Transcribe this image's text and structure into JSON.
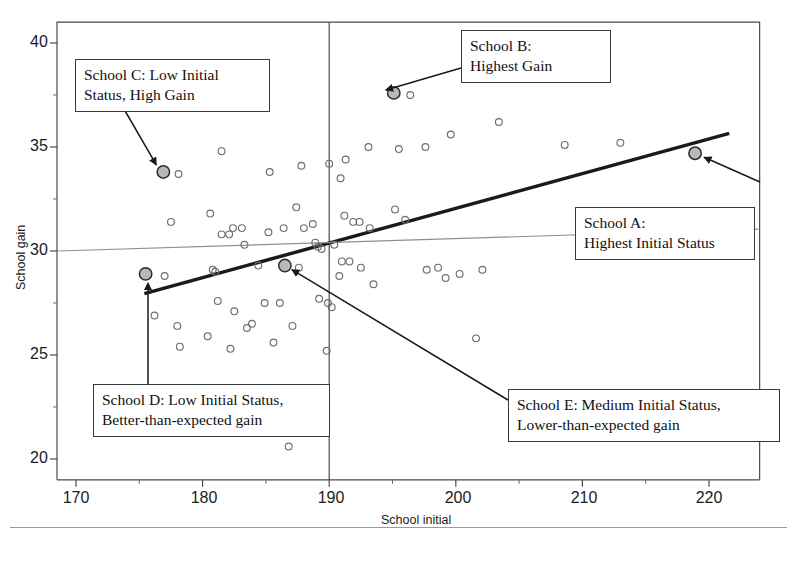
{
  "chart_data": {
    "type": "scatter",
    "title": "",
    "xlabel": "School initial",
    "ylabel": "School gain",
    "xlim": [
      168.5,
      224
    ],
    "ylim": [
      19.0,
      41.0
    ],
    "xticks": [
      170,
      180,
      190,
      200,
      210,
      220
    ],
    "yticks": [
      20,
      25,
      30,
      35,
      40
    ],
    "xminorticks": [
      175,
      185,
      195,
      205,
      215
    ],
    "yminorticks": [
      22.5,
      27.5,
      32.5,
      37.5
    ],
    "grid": false,
    "legend": "none",
    "marker_style": "open-circle",
    "highlight_marker_style": "filled-gray-circle",
    "highlight_fill": "#b8b8b8",
    "highlight_stroke": "#2b2b2b",
    "reference_line_vertical_x": 190,
    "series": [
      {
        "name": "Schools",
        "points": [
          [
            176.9,
            33.8
          ],
          [
            178.1,
            33.7
          ],
          [
            181.5,
            34.8
          ],
          [
            185.3,
            33.8
          ],
          [
            187.8,
            34.1
          ],
          [
            190.0,
            34.2
          ],
          [
            191.3,
            34.4
          ],
          [
            190.9,
            33.5
          ],
          [
            193.1,
            35.0
          ],
          [
            195.1,
            37.6
          ],
          [
            196.4,
            37.5
          ],
          [
            195.5,
            34.9
          ],
          [
            197.6,
            35.0
          ],
          [
            199.6,
            35.6
          ],
          [
            203.4,
            36.2
          ],
          [
            208.6,
            35.1
          ],
          [
            213.0,
            35.2
          ],
          [
            218.9,
            34.7
          ],
          [
            177.5,
            31.4
          ],
          [
            180.6,
            31.8
          ],
          [
            182.4,
            31.1
          ],
          [
            183.1,
            31.1
          ],
          [
            181.5,
            30.8
          ],
          [
            182.1,
            30.8
          ],
          [
            183.3,
            30.3
          ],
          [
            185.2,
            30.9
          ],
          [
            186.4,
            31.1
          ],
          [
            187.4,
            32.1
          ],
          [
            188.0,
            31.1
          ],
          [
            188.7,
            31.3
          ],
          [
            189.1,
            30.2
          ],
          [
            189.4,
            30.1
          ],
          [
            188.9,
            30.4
          ],
          [
            190.4,
            30.3
          ],
          [
            191.2,
            31.7
          ],
          [
            191.9,
            31.4
          ],
          [
            192.4,
            31.4
          ],
          [
            193.2,
            31.1
          ],
          [
            195.2,
            32.0
          ],
          [
            196.0,
            31.5
          ],
          [
            191.0,
            29.5
          ],
          [
            191.6,
            29.5
          ],
          [
            192.5,
            29.2
          ],
          [
            190.8,
            28.8
          ],
          [
            193.5,
            28.4
          ],
          [
            197.7,
            29.1
          ],
          [
            198.6,
            29.2
          ],
          [
            200.3,
            28.9
          ],
          [
            202.1,
            29.1
          ],
          [
            199.2,
            28.7
          ],
          [
            201.6,
            25.8
          ],
          [
            175.5,
            28.9
          ],
          [
            177.0,
            28.8
          ],
          [
            180.8,
            29.1
          ],
          [
            181.0,
            29.0
          ],
          [
            184.4,
            29.3
          ],
          [
            186.5,
            29.3
          ],
          [
            187.6,
            29.2
          ],
          [
            176.2,
            26.9
          ],
          [
            178.0,
            26.4
          ],
          [
            178.2,
            25.4
          ],
          [
            181.2,
            27.6
          ],
          [
            182.5,
            27.1
          ],
          [
            183.5,
            26.3
          ],
          [
            183.9,
            26.5
          ],
          [
            184.9,
            27.5
          ],
          [
            186.1,
            27.5
          ],
          [
            187.1,
            26.4
          ],
          [
            189.2,
            27.7
          ],
          [
            189.9,
            27.5
          ],
          [
            190.2,
            27.3
          ],
          [
            189.8,
            25.2
          ],
          [
            186.8,
            20.6
          ],
          [
            180.4,
            25.9
          ],
          [
            182.2,
            25.3
          ],
          [
            185.6,
            25.6
          ]
        ],
        "color": "#6e6e6e"
      }
    ],
    "highlights": [
      {
        "label": "School A",
        "x": 218.9,
        "y": 34.7
      },
      {
        "label": "School B",
        "x": 195.1,
        "y": 37.6
      },
      {
        "label": "School C",
        "x": 176.9,
        "y": 33.8
      },
      {
        "label": "School D",
        "x": 175.5,
        "y": 28.9
      },
      {
        "label": "School E",
        "x": 186.5,
        "y": 29.3
      }
    ],
    "lines": [
      {
        "name": "regression-line-thick",
        "x0": 175.4,
        "y0": 27.95,
        "x1": 221.6,
        "y1": 35.65,
        "color": "#1a1a1a",
        "width": 3.4
      },
      {
        "name": "mean-gain-line-thin",
        "x0": 168.6,
        "y0": 30.0,
        "x1": 223.9,
        "y1": 31.05,
        "color": "#8f8f8f",
        "width": 1.1
      }
    ],
    "annotations": [
      {
        "id": "school-a",
        "label": "School A:",
        "label2": "Highest Initial Status"
      },
      {
        "id": "school-b",
        "label": "School B:",
        "label2": "Highest Gain"
      },
      {
        "id": "school-c",
        "label": "School C: Low Initial",
        "label2": "Status, High Gain"
      },
      {
        "id": "school-d",
        "label": "School D: Low Initial Status,",
        "label2": "Better-than-expected gain"
      },
      {
        "id": "school-e",
        "label": "School E: Medium Initial Status,",
        "label2": "Lower-than-expected gain"
      }
    ]
  }
}
